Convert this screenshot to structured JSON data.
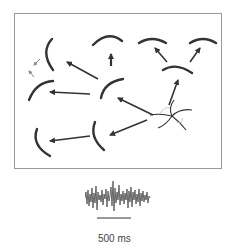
{
  "figure": {
    "scale_bar_label": "500 ms",
    "colors": {
      "stroke": "#333333",
      "border": "#9a9a9a",
      "trace": "#555555"
    }
  }
}
